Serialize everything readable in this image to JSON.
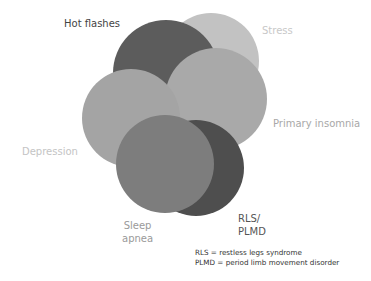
{
  "diagram": {
    "type": "overlapping-circles",
    "circles": [
      {
        "id": "stress",
        "label": "Stress",
        "cx": 211,
        "cy": 61,
        "r": 48,
        "fill": "#c2c2c2"
      },
      {
        "id": "hot-flashes",
        "label": "Hot flashes",
        "cx": 166,
        "cy": 73,
        "r": 53,
        "fill": "#5c5c5c"
      },
      {
        "id": "primary-insomnia",
        "label": "Primary insomnia",
        "cx": 216,
        "cy": 99,
        "r": 51,
        "fill": "#a9a9a9"
      },
      {
        "id": "depression",
        "label": "Depression",
        "cx": 131,
        "cy": 118,
        "r": 49,
        "fill": "#a4a4a4"
      },
      {
        "id": "rls-plmd",
        "label": "RLS/ PLMD",
        "cx": 196,
        "cy": 168,
        "r": 48,
        "fill": "#4e4e4e"
      },
      {
        "id": "sleep-apnea",
        "label": "Sleep apnea",
        "cx": 165,
        "cy": 164,
        "r": 49,
        "fill": "#7d7d7d"
      }
    ],
    "labels": {
      "hot_flashes": "Hot flashes",
      "stress": "Stress",
      "primary_insomnia": "Primary insomnia",
      "depression": "Depression",
      "sleep_apnea_line1": "Sleep",
      "sleep_apnea_line2": "apnea",
      "rls_line1": "RLS/",
      "rls_line2": "PLMD"
    },
    "label_colors": {
      "hot_flashes": "#444444",
      "stress": "#c8c8c8",
      "primary_insomnia": "#a8a8a8",
      "depression": "#c4c4c4",
      "sleep_apnea": "#9a9a9a",
      "rls": "#555555"
    },
    "legend": [
      "RLS = restless legs syndrome",
      "PLMD = period limb movement disorder"
    ]
  }
}
